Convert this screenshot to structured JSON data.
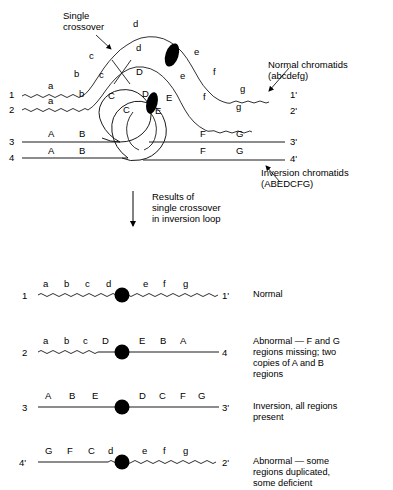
{
  "figure": {
    "annotations": {
      "single_crossover": "Single\ncrossover",
      "normal_chromatids": "Normal chromatids\n(abcdefg)",
      "inversion_chromatids": "Inversion chromatids\n(ABEDCFG)",
      "results_arrow": "Results of\nsingle crossover\nin inversion loop"
    }
  },
  "top_diagram": {
    "strand_numbers_left": [
      "1",
      "2",
      "3",
      "4"
    ],
    "strand_numbers_right": [
      "1'",
      "2'",
      "3'",
      "4'"
    ],
    "normal_labels_upper": [
      "a",
      "b",
      "c",
      "d",
      "e",
      "f",
      "g"
    ],
    "normal_labels_lower": [
      "a",
      "b",
      "c",
      "d",
      "e",
      "f",
      "g"
    ],
    "inversion_labels_upper": [
      "A",
      "B",
      "C",
      "D",
      "E",
      "F",
      "G"
    ],
    "inversion_labels_lower": [
      "A",
      "B",
      "C",
      "D",
      "E",
      "F",
      "G"
    ],
    "loop_labels": [
      "C",
      "D",
      "E"
    ],
    "centromere_count": 2
  },
  "results": {
    "rows": [
      {
        "left_number": "1",
        "right_number": "1'",
        "genes": [
          "a",
          "b",
          "c",
          "d",
          "e",
          "f",
          "g"
        ],
        "description": "Normal"
      },
      {
        "left_number": "2",
        "right_number": "4",
        "genes": [
          "a",
          "b",
          "c",
          "D",
          "E",
          "B",
          "A"
        ],
        "description": "Abnormal — F and G\nregions missing; two\ncopies of A and B\nregions"
      },
      {
        "left_number": "3",
        "right_number": "3'",
        "genes": [
          "A",
          "B",
          "E",
          "D",
          "C",
          "F",
          "G"
        ],
        "description": "Inversion, all regions\npresent"
      },
      {
        "left_number": "4'",
        "right_number": "2'",
        "genes": [
          "G",
          "F",
          "C",
          "d",
          "e",
          "f",
          "g"
        ],
        "description": "Abnormal — some\nregions duplicated,\nsome deficient"
      }
    ]
  },
  "style": {
    "ink": "#000000",
    "line": "#2b2b2b",
    "background": "#ffffff"
  }
}
